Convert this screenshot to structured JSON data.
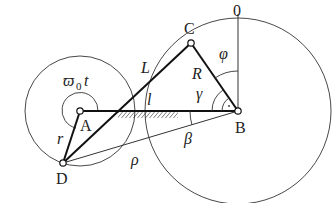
{
  "diagram": {
    "type": "mechanism-kinematic-sketch",
    "points": {
      "A": {
        "label": "A",
        "x": 80,
        "y": 111
      },
      "B": {
        "label": "B",
        "x": 238,
        "y": 111
      },
      "C": {
        "label": "C",
        "x": 191,
        "y": 43
      },
      "D": {
        "label": "D",
        "x": 63,
        "y": 163
      }
    },
    "links": [
      {
        "from": "A",
        "to": "B",
        "label": "l",
        "style": "thick",
        "fixed_ground_hatch": true
      },
      {
        "from": "D",
        "to": "C",
        "label": "L",
        "style": "thick"
      },
      {
        "from": "C",
        "to": "B",
        "label": "R",
        "style": "thick"
      },
      {
        "from": "A",
        "to": "D",
        "label": "r",
        "style": "thick"
      },
      {
        "from": "D",
        "to": "B",
        "label": "ρ",
        "style": "thin"
      }
    ],
    "circles": [
      {
        "center": "A",
        "radius": 55,
        "label": "small crank circle"
      },
      {
        "center": "B",
        "radius": 92,
        "label": "large rocker circle"
      }
    ],
    "angles": {
      "omega0t": "ϖ₀t",
      "phi": "φ",
      "gamma": "γ",
      "beta": "β"
    },
    "reference_axis_label": "0",
    "labels": {
      "A": "A",
      "B": "B",
      "C": "C",
      "D": "D",
      "L": "L",
      "l": "l",
      "R": "R",
      "r": "r",
      "rho": "ρ",
      "phi": "φ",
      "gamma": "γ",
      "beta": "β",
      "omega": "ϖ",
      "omega_sub": "0",
      "omega_t": "t",
      "zero": "0"
    }
  }
}
